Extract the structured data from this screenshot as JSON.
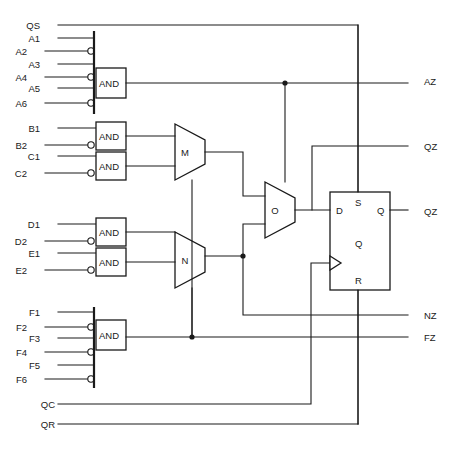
{
  "diagram": {
    "stroke_color": "#1a1a1a",
    "background_color": "#ffffff"
  },
  "inputs": [
    {
      "name": "QS",
      "label": "QS",
      "x": 40,
      "y": 25,
      "inverted": false
    },
    {
      "name": "A1",
      "label": "A1",
      "x": 40,
      "y": 38,
      "inverted": false
    },
    {
      "name": "A2",
      "label": "A2",
      "x": 27,
      "y": 51,
      "inverted": true
    },
    {
      "name": "A3",
      "label": "A3",
      "x": 40,
      "y": 64,
      "inverted": false
    },
    {
      "name": "A4",
      "label": "A4",
      "x": 27,
      "y": 77,
      "inverted": true
    },
    {
      "name": "A5",
      "label": "A5",
      "x": 40,
      "y": 88,
      "inverted": false
    },
    {
      "name": "A6",
      "label": "A6",
      "x": 27,
      "y": 103,
      "inverted": true
    },
    {
      "name": "B1",
      "label": "B1",
      "x": 40,
      "y": 128,
      "inverted": false
    },
    {
      "name": "B2",
      "label": "B2",
      "x": 27,
      "y": 145,
      "inverted": true
    },
    {
      "name": "C1",
      "label": "C1",
      "x": 40,
      "y": 156,
      "inverted": false
    },
    {
      "name": "C2",
      "label": "C2",
      "x": 27,
      "y": 173,
      "inverted": true
    },
    {
      "name": "D1",
      "label": "D1",
      "x": 40,
      "y": 224,
      "inverted": false
    },
    {
      "name": "D2",
      "label": "D2",
      "x": 27,
      "y": 241,
      "inverted": true
    },
    {
      "name": "E1",
      "label": "E1",
      "x": 40,
      "y": 253,
      "inverted": false
    },
    {
      "name": "E2",
      "label": "E2",
      "x": 27,
      "y": 270,
      "inverted": true
    },
    {
      "name": "F1",
      "label": "F1",
      "x": 40,
      "y": 312,
      "inverted": false
    },
    {
      "name": "F2",
      "label": "F2",
      "x": 27,
      "y": 327,
      "inverted": true
    },
    {
      "name": "F3",
      "label": "F3",
      "x": 40,
      "y": 338,
      "inverted": false
    },
    {
      "name": "F4",
      "label": "F4",
      "x": 27,
      "y": 352,
      "inverted": true
    },
    {
      "name": "F5",
      "label": "F5",
      "x": 40,
      "y": 365,
      "inverted": false
    },
    {
      "name": "F6",
      "label": "F6",
      "x": 27,
      "y": 379,
      "inverted": true
    },
    {
      "name": "QC",
      "label": "QC",
      "x": 40,
      "y": 404,
      "inverted": false
    },
    {
      "name": "QR",
      "label": "QR",
      "x": 40,
      "y": 424,
      "inverted": false
    }
  ],
  "outputs": [
    {
      "name": "AZ",
      "label": "AZ",
      "x": 424,
      "y": 81
    },
    {
      "name": "QZ",
      "label": "QZ",
      "x": 424,
      "y": 146
    },
    {
      "name": "QZ-2",
      "label": "QZ",
      "x": 424,
      "y": 211
    },
    {
      "name": "NZ",
      "label": "NZ",
      "x": 424,
      "y": 315
    },
    {
      "name": "FZ",
      "label": "FZ",
      "x": 424,
      "y": 337
    }
  ],
  "and_gates": [
    {
      "name": "and-gate-a",
      "label": "AND",
      "x": 96,
      "y": 68,
      "w": 30,
      "h": 30,
      "bar_top": 31,
      "bar_bottom": 114
    },
    {
      "name": "and-gate-b",
      "label": "AND",
      "x": 96,
      "y": 122,
      "w": 30,
      "h": 28,
      "bar_top": 0,
      "bar_bottom": 0
    },
    {
      "name": "and-gate-c",
      "label": "AND",
      "x": 96,
      "y": 152,
      "w": 30,
      "h": 28,
      "bar_top": 0,
      "bar_bottom": 0
    },
    {
      "name": "and-gate-d",
      "label": "AND",
      "x": 96,
      "y": 218,
      "w": 30,
      "h": 28,
      "bar_top": 0,
      "bar_bottom": 0
    },
    {
      "name": "and-gate-e",
      "label": "AND",
      "x": 96,
      "y": 248,
      "w": 30,
      "h": 28,
      "bar_top": 0,
      "bar_bottom": 0
    },
    {
      "name": "and-gate-f",
      "label": "AND",
      "x": 96,
      "y": 320,
      "w": 30,
      "h": 30,
      "bar_top": 307,
      "bar_bottom": 388
    }
  ],
  "multiplexers": [
    {
      "name": "mux-m",
      "label": "M",
      "x": 175,
      "y": 124,
      "w": 30,
      "h": 56
    },
    {
      "name": "mux-n",
      "label": "N",
      "x": 175,
      "y": 232,
      "w": 30,
      "h": 56
    },
    {
      "name": "mux-o",
      "label": "O",
      "x": 265,
      "y": 182,
      "w": 30,
      "h": 56
    }
  ],
  "flipflop": {
    "name": "d-flip-flop",
    "x": 330,
    "y": 192,
    "w": 60,
    "h": 98,
    "pins": {
      "d": "D",
      "s": "S",
      "q_out": "Q",
      "q_center": "Q",
      "r": "R"
    }
  }
}
